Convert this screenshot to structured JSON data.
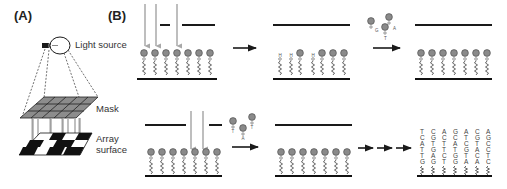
{
  "figure": {
    "panel_a": {
      "label": "(A)",
      "labels": {
        "light_source": "Light source",
        "mask": "Mask",
        "array_line1": "Array",
        "array_line2": "surface"
      }
    },
    "panel_b": {
      "label": "(B)",
      "steps": [
        {
          "id": "step1",
          "description": "Light through mask deprotects selected sites",
          "beads": 7
        },
        {
          "id": "step2",
          "description": "Deprotected sites with exposed hydroxyl groups",
          "pattern": [
            "OH",
            "OH",
            "bead",
            "OH",
            "bead",
            "bead",
            "bead"
          ]
        },
        {
          "id": "step3",
          "description": "Coupling of protected nucleotides; all sites protected",
          "beads": 7
        },
        {
          "id": "step4",
          "description": "Second mask exposes different sites",
          "beads": 7
        },
        {
          "id": "step5",
          "description": "Second coupling step",
          "beads": 7
        },
        {
          "id": "step6",
          "description": "Final synthesized oligonucleotide array"
        }
      ],
      "nucleotide_labels": {
        "first_coupling": [
          "G",
          "A",
          "T"
        ],
        "second_coupling": [
          "T",
          "A",
          "T"
        ],
        "row1_step3_bases": [
          "T",
          "C",
          "A",
          "T",
          "G",
          "A",
          "C"
        ],
        "row2_step4_bases": [
          "G",
          "G",
          "G",
          "G",
          "G",
          "G",
          "A"
        ],
        "row2_step5_bases": [
          "G",
          "G",
          "G",
          "G",
          "G",
          "A",
          "A"
        ]
      },
      "final_sequences": [
        [
          "T",
          "C",
          "A",
          "T",
          "T",
          "G"
        ],
        [
          "C",
          "G",
          "T",
          "G",
          "A",
          "G"
        ],
        [
          "A",
          "C",
          "T",
          "T",
          "C",
          "T"
        ],
        [
          "G",
          "C",
          "A",
          "T",
          "G",
          "G"
        ],
        [
          "A",
          "T",
          "C",
          "G",
          "T",
          "A"
        ],
        [
          "C",
          "G",
          "T",
          "A",
          "C",
          "A"
        ],
        [
          "A",
          "G",
          "C",
          "C",
          "T",
          "C"
        ]
      ]
    },
    "colors": {
      "bead": "#8a8a8a",
      "mask_cell": "#8c8c8c",
      "light_arrow": "#a8a8a8",
      "ink": "#1a1a1a"
    }
  }
}
